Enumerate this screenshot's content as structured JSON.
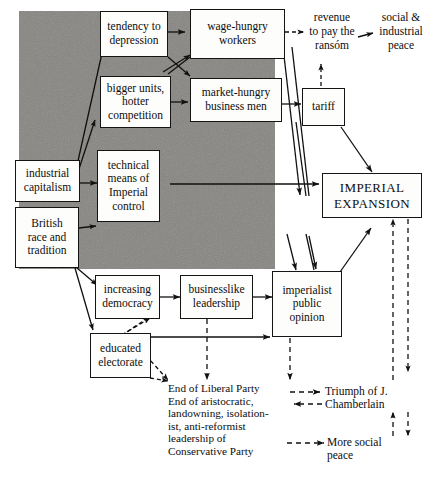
{
  "diagram": {
    "colors": {
      "shaded_region": "#787672",
      "ink": "#0d0d0d",
      "paper": "#fdfdfb"
    },
    "nodes": [
      {
        "id": "tendency-to-depression",
        "label": "tendency to\ndepression"
      },
      {
        "id": "wage-hungry-workers",
        "label": "wage-hungry\nworkers"
      },
      {
        "id": "bigger-units",
        "label": "bigger units,\nhotter\ncompetition"
      },
      {
        "id": "market-hungry-business-men",
        "label": "market-hungry\nbusiness men"
      },
      {
        "id": "tariff",
        "label": "tariff"
      },
      {
        "id": "industrial-capitalism",
        "label": "industrial\ncapitalism"
      },
      {
        "id": "technical-means",
        "label": "technical\nmeans of\nImperial\ncontrol"
      },
      {
        "id": "british-race-and-tradition",
        "label": "British\nrace and\ntradition"
      },
      {
        "id": "imperial-expansion",
        "label": "IMPERIAL\nEXPANSION"
      },
      {
        "id": "increasing-democracy",
        "label": "increasing\ndemocracy"
      },
      {
        "id": "businesslike-leadership",
        "label": "businesslike\nleadership"
      },
      {
        "id": "imperialist-public-opinion",
        "label": "imperialist\npublic\nopinion"
      },
      {
        "id": "educated-electorate",
        "label": "educated\nelectorate"
      }
    ],
    "labels": [
      {
        "id": "revenue-to-pay-the-ransom",
        "label": "revenue\nto pay the\nransóm"
      },
      {
        "id": "social-and-industrial-peace",
        "label": "social &\nindustrial\npeace"
      },
      {
        "id": "end-of-liberal-party",
        "label": "End of Liberal Party\nEnd of aristocratic,\nlandowning, isolation-\nist, anti-reformist\nleadership of\nConservative Party"
      },
      {
        "id": "triumph-of-j-chamberlain",
        "label": "Triumph of J.\nChamberlain"
      },
      {
        "id": "more-social-peace",
        "label": "More social\npeace"
      }
    ]
  }
}
